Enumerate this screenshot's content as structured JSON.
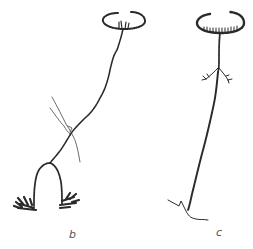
{
  "figure": {
    "panels": [
      {
        "id": "b",
        "label": "b",
        "label_pos": {
          "x": 72,
          "y": 230
        },
        "description": "polyp with tentacle ring at top, long stalk, forked base with two tufted feet, crossed by a grass blade"
      },
      {
        "id": "c",
        "label": "c",
        "label_pos": {
          "x": 217,
          "y": 228
        },
        "description": "polyp with fringed tentacle ring, lateral branchlets, long stalk and root-like holdfast"
      }
    ],
    "colors": {
      "ink": "#2a2a2a",
      "label": "#555555",
      "background": "#ffffff"
    }
  }
}
